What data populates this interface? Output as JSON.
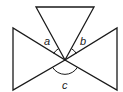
{
  "diagram": {
    "colors": {
      "stroke": "#1a1a1a",
      "label": "#222222",
      "background": "#ffffff"
    },
    "vertex": {
      "x": 65,
      "y": 60
    },
    "triangles": [
      {
        "name": "top-triangle",
        "points": "36,7 94,7 65,60"
      },
      {
        "name": "left-triangle",
        "points": "13,28 13,90 65,60"
      },
      {
        "name": "right-triangle",
        "points": "117,28 117,90 65,60"
      }
    ],
    "angles": [
      {
        "name": "a",
        "label": "a",
        "x": 44,
        "y": 45
      },
      {
        "name": "b",
        "label": "b",
        "x": 80,
        "y": 45
      },
      {
        "name": "c",
        "label": "c",
        "x": 62,
        "y": 89
      }
    ]
  }
}
